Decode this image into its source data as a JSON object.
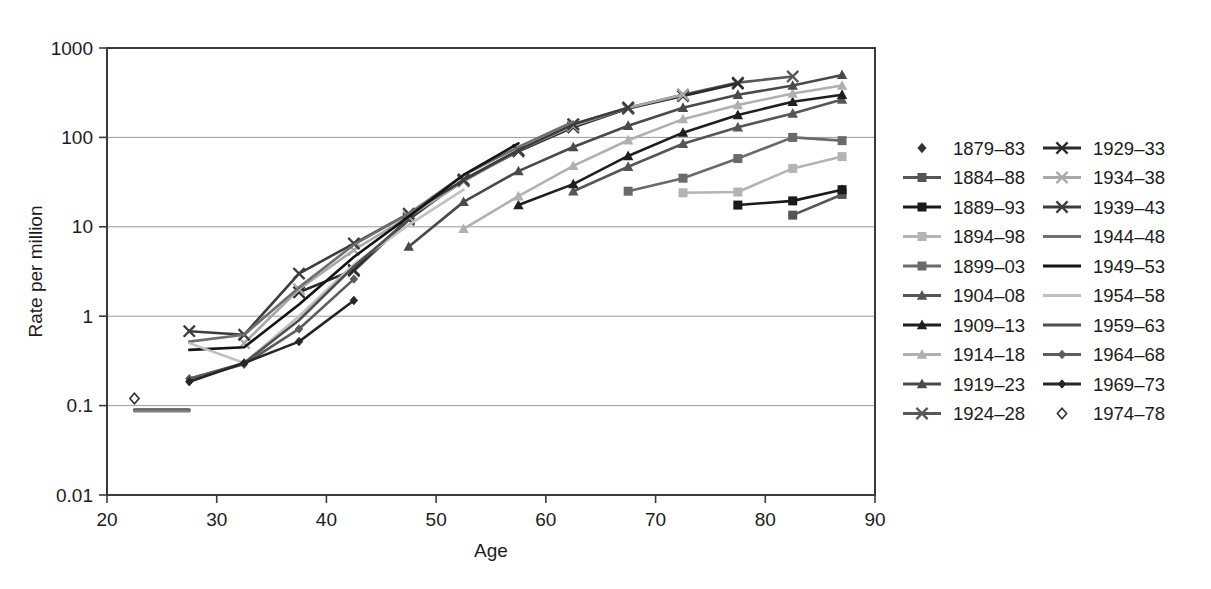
{
  "chart_data": {
    "type": "line",
    "title": "",
    "xlabel": "Age",
    "ylabel": "Rate per million",
    "xlim": [
      20,
      90
    ],
    "ylim": [
      0.01,
      1000
    ],
    "yscale": "log",
    "grid": true,
    "legend_position": "right",
    "legend_columns": 2,
    "x_ticks": [
      "20",
      "30",
      "40",
      "50",
      "60",
      "70",
      "80",
      "90"
    ],
    "x_tick_values": [
      20,
      30,
      40,
      50,
      60,
      70,
      80,
      90
    ],
    "y_ticks": [
      "0.01",
      "0.1",
      "1",
      "10",
      "100",
      "1000"
    ],
    "y_tick_values": [
      0.01,
      0.1,
      1,
      10,
      100,
      1000
    ],
    "series": [
      {
        "name": "1879–83",
        "marker": "diamond-filled",
        "color": "#333333",
        "line": false,
        "x": [
          87
        ],
        "values": [
          26
        ]
      },
      {
        "name": "1884–88",
        "marker": "square-filled",
        "color": "#555555",
        "line": true,
        "x": [
          82.5,
          87
        ],
        "values": [
          13.5,
          23
        ]
      },
      {
        "name": "1889–93",
        "marker": "square-filled",
        "color": "#1a1a1a",
        "line": true,
        "x": [
          77.5,
          82.5,
          87
        ],
        "values": [
          17.5,
          19.5,
          26
        ]
      },
      {
        "name": "1894–98",
        "marker": "square-filled",
        "color": "#b4b4b4",
        "line": true,
        "x": [
          72.5,
          77.5,
          82.5,
          87
        ],
        "values": [
          24,
          24.5,
          45,
          61
        ]
      },
      {
        "name": "1899–03",
        "marker": "square-filled",
        "color": "#6a6a6a",
        "line": true,
        "x": [
          67.5,
          72.5,
          77.5,
          82.5,
          87
        ],
        "values": [
          25,
          35,
          58,
          100,
          92
        ]
      },
      {
        "name": "1904–08",
        "marker": "triangle-filled",
        "color": "#565656",
        "line": true,
        "x": [
          62.5,
          67.5,
          72.5,
          77.5,
          82.5,
          87
        ],
        "values": [
          25,
          47,
          85,
          130,
          185,
          265
        ]
      },
      {
        "name": "1909–13",
        "marker": "triangle-filled",
        "color": "#1f1f1f",
        "line": true,
        "x": [
          57.5,
          62.5,
          67.5,
          72.5,
          77.5,
          82.5,
          87
        ],
        "values": [
          17.5,
          30,
          62,
          113,
          178,
          250,
          300
        ]
      },
      {
        "name": "1914–18",
        "marker": "triangle-filled",
        "color": "#b0b0b0",
        "line": true,
        "x": [
          52.5,
          57.5,
          62.5,
          67.5,
          72.5,
          77.5,
          82.5,
          87
        ],
        "values": [
          9.5,
          22,
          48,
          93,
          160,
          230,
          310,
          380
        ]
      },
      {
        "name": "1919–23",
        "marker": "triangle-filled",
        "color": "#4a4a4a",
        "line": true,
        "x": [
          47.5,
          52.5,
          57.5,
          62.5,
          67.5,
          72.5,
          77.5,
          82.5,
          87
        ],
        "values": [
          6,
          19,
          42,
          78,
          135,
          215,
          300,
          380,
          500
        ]
      },
      {
        "name": "1924–28",
        "marker": "x-cross",
        "color": "#585858",
        "line": true,
        "x": [
          42.5,
          47.5,
          52.5,
          57.5,
          62.5,
          67.5,
          72.5,
          77.5,
          82.5
        ],
        "values": [
          3.2,
          12,
          34,
          72,
          140,
          215,
          300,
          410,
          480
        ]
      },
      {
        "name": "1929–33",
        "marker": "x-cross",
        "color": "#2b2b2b",
        "line": true,
        "x": [
          37.5,
          42.5,
          47.5,
          52.5,
          57.5,
          62.5,
          67.5,
          72.5,
          77.5
        ],
        "values": [
          1.85,
          3.3,
          12.5,
          33,
          70,
          130,
          210,
          290,
          400
        ]
      },
      {
        "name": "1934–38",
        "marker": "x-cross",
        "color": "#a8a8a8",
        "line": true,
        "x": [
          32.5,
          37.5,
          42.5,
          47.5,
          52.5,
          57.5,
          62.5,
          67.5,
          72.5
        ],
        "values": [
          0.5,
          2.0,
          5.5,
          13,
          32,
          72,
          135,
          215,
          300
        ]
      },
      {
        "name": "1939–43",
        "marker": "x-cross",
        "color": "#3d3d3d",
        "line": true,
        "x": [
          27.5,
          32.5,
          37.5,
          42.5,
          47.5,
          52.5,
          57.5,
          62.5,
          67.5
        ],
        "values": [
          0.68,
          0.62,
          3.0,
          6.5,
          14,
          33,
          72,
          140,
          215
        ]
      },
      {
        "name": "1944–48",
        "marker": "none",
        "color": "#6e6e6e",
        "line": true,
        "x": [
          27.5,
          32.5,
          37.5,
          42.5,
          47.5,
          52.5,
          57.5,
          62.5
        ],
        "values": [
          0.52,
          0.62,
          2.1,
          6.3,
          14,
          38,
          78,
          150
        ]
      },
      {
        "name": "1949–53",
        "marker": "none",
        "color": "#141414",
        "line": true,
        "x": [
          27.5,
          32.5,
          37.5,
          42.5,
          47.5,
          52.5,
          57.5
        ],
        "values": [
          0.42,
          0.45,
          1.35,
          4.6,
          13,
          38,
          86
        ]
      },
      {
        "name": "1954–58",
        "marker": "none",
        "color": "#c0c0c0",
        "line": true,
        "x": [
          27.5,
          32.5,
          37.5,
          42.5,
          47.5,
          52.5
        ],
        "values": [
          0.5,
          0.3,
          1.0,
          3.8,
          10.5,
          26
        ]
      },
      {
        "name": "1959–63",
        "marker": "none",
        "color": "#4f4f4f",
        "line": true,
        "x": [
          27.5,
          32.5,
          37.5,
          42.5,
          47.5
        ],
        "values": [
          0.2,
          0.3,
          0.9,
          3.6,
          12
        ]
      },
      {
        "name": "1964–68",
        "marker": "diamond-small",
        "color": "#5c5c5c",
        "line": true,
        "x": [
          27.5,
          32.5,
          37.5,
          42.5
        ],
        "values": [
          0.2,
          0.29,
          0.72,
          2.6
        ]
      },
      {
        "name": "1969–73",
        "marker": "diamond-small",
        "color": "#262626",
        "line": true,
        "x": [
          27.5,
          32.5,
          37.5,
          42.5
        ],
        "values": [
          0.185,
          0.3,
          0.52,
          1.5
        ]
      },
      {
        "name": "1974–78",
        "marker": "diamond-open",
        "color": "#2f2f2f",
        "line": false,
        "x": [
          22.5
        ],
        "values": [
          0.12
        ]
      }
    ],
    "baseline_series": [
      {
        "name": "baseline-low",
        "color": "#4a4a4a",
        "x": [
          22.5,
          27.5
        ],
        "values": [
          0.09,
          0.09
        ]
      },
      {
        "name": "baseline-low-2",
        "color": "#7d7d7d",
        "x": [
          22.5,
          27.5
        ],
        "values": [
          0.087,
          0.087
        ]
      }
    ]
  },
  "legend": {
    "items": [
      {
        "label": "1879–83",
        "marker": "diamond-filled",
        "color": "#333333",
        "line": false
      },
      {
        "label": "1929–33",
        "marker": "x-cross",
        "color": "#2b2b2b",
        "line": true
      },
      {
        "label": "1884–88",
        "marker": "square-filled",
        "color": "#555555",
        "line": true
      },
      {
        "label": "1934–38",
        "marker": "x-cross",
        "color": "#a8a8a8",
        "line": true
      },
      {
        "label": "1889–93",
        "marker": "square-filled",
        "color": "#1a1a1a",
        "line": true
      },
      {
        "label": "1939–43",
        "marker": "x-cross",
        "color": "#3d3d3d",
        "line": true
      },
      {
        "label": "1894–98",
        "marker": "square-filled",
        "color": "#b4b4b4",
        "line": true
      },
      {
        "label": "1944–48",
        "marker": "none",
        "color": "#6e6e6e",
        "line": true
      },
      {
        "label": "1899–03",
        "marker": "square-filled",
        "color": "#6a6a6a",
        "line": true
      },
      {
        "label": "1949–53",
        "marker": "none",
        "color": "#141414",
        "line": true
      },
      {
        "label": "1904–08",
        "marker": "triangle-filled",
        "color": "#565656",
        "line": true
      },
      {
        "label": "1954–58",
        "marker": "none",
        "color": "#c0c0c0",
        "line": true
      },
      {
        "label": "1909–13",
        "marker": "triangle-filled",
        "color": "#1f1f1f",
        "line": true
      },
      {
        "label": "1959–63",
        "marker": "none",
        "color": "#4f4f4f",
        "line": true
      },
      {
        "label": "1914–18",
        "marker": "triangle-filled",
        "color": "#b0b0b0",
        "line": true
      },
      {
        "label": "1964–68",
        "marker": "diamond-small",
        "color": "#5c5c5c",
        "line": true
      },
      {
        "label": "1919–23",
        "marker": "triangle-filled",
        "color": "#4a4a4a",
        "line": true
      },
      {
        "label": "1969–73",
        "marker": "diamond-small",
        "color": "#262626",
        "line": true
      },
      {
        "label": "1924–28",
        "marker": "x-cross",
        "color": "#585858",
        "line": true
      },
      {
        "label": "1974–78",
        "marker": "diamond-open",
        "color": "#2f2f2f",
        "line": false
      }
    ]
  },
  "colors": {
    "background": "#ffffff",
    "axis": "#3a3a3a",
    "grid": "#9b9b9b",
    "text": "#1c1c1c"
  }
}
